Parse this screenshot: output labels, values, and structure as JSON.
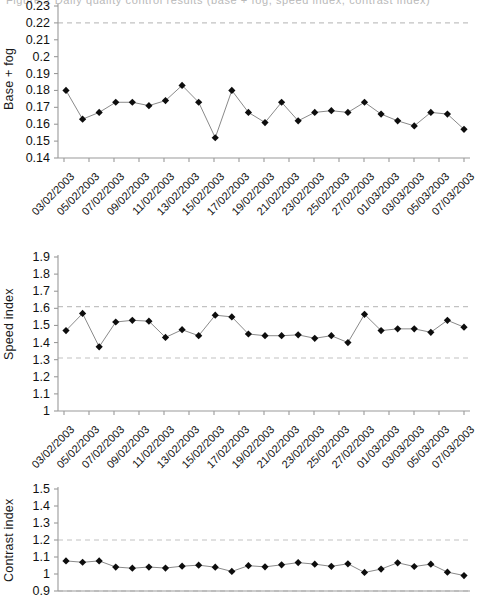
{
  "figure": {
    "cut_off_header": "Figure 2  Daily quality control results (base + fog, speed index, contrast index)"
  },
  "chart_data": [
    {
      "type": "line",
      "title": "",
      "ylabel": "Base + fog",
      "xlabel": "",
      "ylim": [
        0.14,
        0.23
      ],
      "yticks": [
        "0.14",
        "0.15",
        "0.16",
        "0.17",
        "0.18",
        "0.19",
        "0.2",
        "0.21",
        "0.22",
        "0.23"
      ],
      "ytick_values": [
        0.14,
        0.15,
        0.16,
        0.17,
        0.18,
        0.19,
        0.2,
        0.21,
        0.22,
        0.23
      ],
      "grid": false,
      "legend": "none",
      "control_limits": [
        0.22
      ],
      "x": [
        "03/02/2003",
        "04/02/2003",
        "05/02/2003",
        "06/02/2003",
        "07/02/2003",
        "08/02/2003",
        "09/02/2003",
        "10/02/2003",
        "11/02/2003",
        "12/02/2003",
        "13/02/2003",
        "14/02/2003",
        "15/02/2003",
        "16/02/2003",
        "17/02/2003",
        "18/02/2003",
        "19/02/2003",
        "20/02/2003",
        "21/02/2003",
        "22/02/2003",
        "23/02/2003",
        "24/02/2003",
        "25/02/2003",
        "26/02/2003",
        "27/02/2003",
        "28/02/2003",
        "01/03/2003",
        "02/03/2003",
        "03/03/2003",
        "04/03/2003",
        "05/03/2003",
        "06/03/2003",
        "07/03/2003"
      ],
      "xtick_labels": [
        "03/02/2003",
        "05/02/2003",
        "07/02/2003",
        "09/02/2003",
        "11/02/2003",
        "13/02/2003",
        "15/02/2003",
        "17/02/2003",
        "19/02/2003",
        "21/02/2003",
        "23/02/2003",
        "25/02/2003",
        "27/02/2003",
        "01/03/2003",
        "03/03/2003",
        "05/03/2003",
        "07/03/2003"
      ],
      "values": [
        0.18,
        0.163,
        0.167,
        0.173,
        0.173,
        0.171,
        0.174,
        0.183,
        0.173,
        0.152,
        0.18,
        0.167,
        0.161,
        0.173,
        0.162,
        0.167,
        0.168,
        0.167,
        0.173,
        0.166,
        0.162,
        0.159,
        0.167,
        0.166,
        0.157
      ]
    },
    {
      "type": "line",
      "title": "",
      "ylabel": "Speed index",
      "xlabel": "",
      "ylim": [
        1.0,
        1.9
      ],
      "yticks": [
        "1",
        "1.1",
        "1.2",
        "1.3",
        "1.4",
        "1.5",
        "1.6",
        "1.7",
        "1.8",
        "1.9"
      ],
      "ytick_values": [
        1.0,
        1.1,
        1.2,
        1.3,
        1.4,
        1.5,
        1.6,
        1.7,
        1.8,
        1.9
      ],
      "grid": false,
      "legend": "none",
      "control_limits": [
        1.61,
        1.31
      ],
      "xtick_labels": [
        "03/02/2003",
        "05/02/2003",
        "07/02/2003",
        "09/02/2003",
        "11/02/2003",
        "13/02/2003",
        "15/02/2003",
        "17/02/2003",
        "19/02/2003",
        "21/02/2003",
        "23/02/2003",
        "25/02/2003",
        "27/02/2003",
        "01/03/2003",
        "03/03/2003",
        "05/03/2003",
        "07/03/2003"
      ],
      "values": [
        1.47,
        1.57,
        1.375,
        1.52,
        1.53,
        1.525,
        1.43,
        1.475,
        1.44,
        1.56,
        1.55,
        1.45,
        1.44,
        1.44,
        1.445,
        1.425,
        1.44,
        1.4,
        1.565,
        1.47,
        1.48,
        1.48,
        1.46,
        1.53,
        1.49
      ]
    },
    {
      "type": "line",
      "title": "",
      "ylabel": "Contrast index",
      "xlabel": "",
      "ylim": [
        0.9,
        1.5
      ],
      "yticks": [
        "0.9",
        "1",
        "1.1",
        "1.2",
        "1.3",
        "1.4",
        "1.5"
      ],
      "ytick_values": [
        0.9,
        1.0,
        1.1,
        1.2,
        1.3,
        1.4,
        1.5
      ],
      "grid": false,
      "legend": "none",
      "control_limits": [
        1.2,
        0.9
      ],
      "xtick_labels": [
        "03/02/2003",
        "05/02/2003",
        "07/02/2003",
        "09/02/2003",
        "11/02/2003",
        "13/02/2003",
        "15/02/2003",
        "17/02/2003",
        "19/02/2003",
        "21/02/2003",
        "23/02/2003",
        "25/02/2003",
        "27/02/2003",
        "01/03/2003",
        "03/03/2003",
        "05/03/2003",
        "07/03/2003"
      ],
      "values": [
        1.077,
        1.069,
        1.077,
        1.041,
        1.034,
        1.041,
        1.035,
        1.046,
        1.052,
        1.04,
        1.015,
        1.049,
        1.042,
        1.054,
        1.067,
        1.058,
        1.045,
        1.06,
        1.009,
        1.029,
        1.066,
        1.044,
        1.058,
        1.011,
        0.991
      ]
    }
  ],
  "style": {
    "marker_color": "#0d0d0d",
    "line_color": "#8a8a8a",
    "axis_color": "#9a9a9a",
    "limit_line_color": "#c2c2c2",
    "text_color": "#111111"
  }
}
